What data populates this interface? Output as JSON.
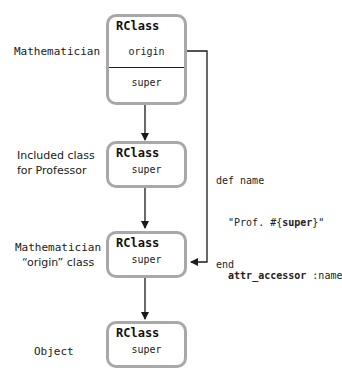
{
  "diagram": {
    "type": "ruby-class-hierarchy",
    "nodes": [
      {
        "id": "mathematician",
        "side_label": "Mathematician",
        "box_title": "RClass",
        "fields": [
          "origin",
          "super"
        ]
      },
      {
        "id": "included-class",
        "side_label_lines": [
          "Included class",
          "for Professor"
        ],
        "box_title": "RClass",
        "fields": [
          "super"
        ]
      },
      {
        "id": "mathematician-origin",
        "side_label_lines": [
          "Mathematician",
          "“origin” class"
        ],
        "box_title": "RClass",
        "fields": [
          "super"
        ]
      },
      {
        "id": "object",
        "side_label": "Object",
        "box_title": "RClass",
        "fields": [
          "super"
        ]
      }
    ],
    "edges": [
      {
        "from": "mathematician.super",
        "to": "included-class",
        "style": "arrow-down"
      },
      {
        "from": "included-class.super",
        "to": "mathematician-origin",
        "style": "arrow-down"
      },
      {
        "from": "mathematician-origin.super",
        "to": "object",
        "style": "arrow-down"
      },
      {
        "from": "mathematician.origin",
        "to": "mathematician-origin",
        "style": "elbow-arrow-left"
      }
    ],
    "annotations": {
      "method_def": {
        "line1": "def name",
        "line2_prefix": "  \"Prof. #{",
        "line2_bold": "super",
        "line2_suffix": "}\"",
        "line3": "end"
      },
      "attr": {
        "bold": "attr_accessor",
        "rest": " :name"
      }
    },
    "colors": {
      "box_border": "#a8a8a8",
      "line": "#1a1a1a",
      "text": "#1a1a1a"
    }
  }
}
